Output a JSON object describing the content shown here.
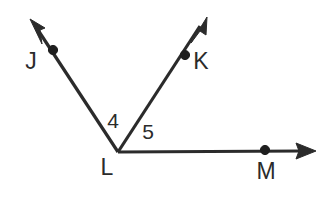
{
  "figure": {
    "background_color": "#ffffff",
    "stroke_color": "#2b2b2b",
    "dot_color": "#1e1e1e",
    "vertex": {
      "label": "L",
      "x": 118,
      "y": 152,
      "label_x": 107,
      "label_y": 168
    },
    "rays": [
      {
        "name": "ray-LJ",
        "point_label": "J",
        "from_x": 118,
        "from_y": 152,
        "to_x": 34,
        "to_y": 24,
        "tip_x": 30,
        "tip_y": 19,
        "dot_x": 53,
        "dot_y": 50,
        "label_x": 31,
        "label_y": 62
      },
      {
        "name": "ray-LK",
        "point_label": "K",
        "from_x": 118,
        "from_y": 152,
        "to_x": 202,
        "to_y": 23,
        "tip_x": 207,
        "tip_y": 17,
        "dot_x": 185,
        "dot_y": 55,
        "label_x": 201,
        "label_y": 62
      },
      {
        "name": "ray-LM",
        "point_label": "M",
        "from_x": 118,
        "from_y": 152,
        "to_x": 303,
        "to_y": 151,
        "tip_x": 316,
        "tip_y": 151,
        "dot_x": 265,
        "dot_y": 150,
        "label_x": 266,
        "label_y": 172
      }
    ],
    "angles": [
      {
        "name": "angle-4",
        "label": "4",
        "between": "ray-LJ and ray-LK",
        "x": 113,
        "y": 122
      },
      {
        "name": "angle-5",
        "label": "5",
        "between": "ray-LK and ray-LM",
        "x": 148,
        "y": 133
      }
    ]
  }
}
